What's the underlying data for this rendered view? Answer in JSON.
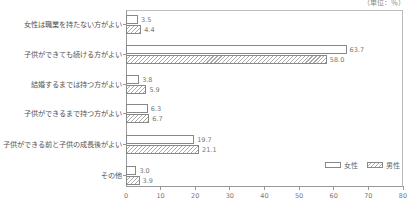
{
  "chart_data": {
    "type": "bar",
    "orientation": "horizontal",
    "title": "",
    "unit_label": "（単位：％）",
    "categories": [
      "女性は職業を持たない方がよい",
      "子供ができても続ける方がよい",
      "結婚するまでは持つ方がよい",
      "子供ができるまで持つ方がよい",
      "子供ができる前と子供の成長後がよい",
      "その他"
    ],
    "series": [
      {
        "name": "女性",
        "values": [
          3.5,
          63.7,
          3.8,
          6.3,
          19.7,
          3.0
        ],
        "values_text": [
          "3.5",
          "63.7",
          "3.8",
          "6.3",
          "19.7",
          "3.0"
        ],
        "pattern": "plain"
      },
      {
        "name": "男性",
        "values": [
          4.4,
          58.0,
          5.9,
          6.7,
          21.1,
          3.9
        ],
        "values_text": [
          "4.4",
          "58.0",
          "5.9",
          "6.7",
          "21.1",
          "3.9"
        ],
        "pattern": "hatched"
      }
    ],
    "xlim": [
      0,
      80
    ],
    "xticks": [
      "0",
      "10",
      "20",
      "30",
      "40",
      "50",
      "60",
      "70",
      "80"
    ],
    "xlabel": "",
    "ylabel": "",
    "grid": false,
    "legend_position": "lower right"
  }
}
